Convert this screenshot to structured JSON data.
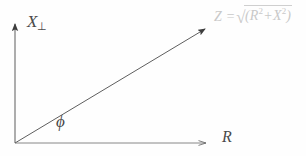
{
  "figure": {
    "type": "phasor-impedance-diagram",
    "background_color": "#fefefe",
    "line_color": "#5a5a5a",
    "formula_color": "#c9c9c9"
  },
  "axes": {
    "vertical": {
      "symbol": "X",
      "subscript": "⊥",
      "label": "X⊥",
      "arrow": true
    },
    "horizontal": {
      "symbol": "R",
      "label": "R",
      "arrow": true
    }
  },
  "vector": {
    "label": "Z",
    "equals": "=",
    "radical_sign": "√",
    "radicand_open": "(",
    "term_1_base": "R",
    "term_1_exp": "2",
    "plus": "+",
    "term_2_base": "X",
    "term_2_exp": "2",
    "radicand_close": ")",
    "full_label": "Z = √(R² + X²)"
  },
  "angle": {
    "symbol": "ϕ",
    "name": "phi"
  },
  "geometry": {
    "origin_x": 15,
    "origin_y": 143,
    "vertical_tip_y": 20,
    "horizontal_tip_x": 211,
    "vector_tip_x": 211,
    "vector_tip_y": 25
  }
}
